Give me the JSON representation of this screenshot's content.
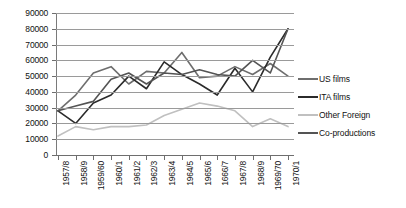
{
  "chart_data": {
    "type": "line",
    "title": "",
    "xlabel": "",
    "ylabel": "",
    "ylim": [
      0,
      90000
    ],
    "ytick_step": 10000,
    "grid": true,
    "legend_position": "right",
    "categories": [
      "1957/8",
      "1958/9",
      "1959/60",
      "1960/1",
      "1961/2",
      "1962/3",
      "1963/4",
      "1964/5",
      "1965/6",
      "1666/7",
      "1967/8",
      "1968/9",
      "1969/70",
      "1970/1"
    ],
    "ytick_labels": [
      "90000",
      "80000",
      "70000",
      "60000",
      "50000",
      "40000",
      "30000",
      "20000",
      "10000",
      "0"
    ],
    "series": [
      {
        "name": "US films",
        "color": "#6e6e6e",
        "values": [
          28000,
          38000,
          52000,
          56000,
          45000,
          53000,
          52000,
          65000,
          49000,
          50000,
          56000,
          51000,
          58000,
          50000
        ]
      },
      {
        "name": "ITA films",
        "color": "#2b2b2b",
        "values": [
          28000,
          20000,
          33000,
          38000,
          50000,
          42000,
          59000,
          51000,
          45000,
          38000,
          55000,
          40000,
          62000,
          80000
        ]
      },
      {
        "name": "Other Foreign",
        "color": "#c0c0c0",
        "values": [
          12000,
          18000,
          16000,
          18000,
          18000,
          19000,
          25000,
          29000,
          33000,
          31000,
          28000,
          18000,
          23000,
          18000
        ]
      },
      {
        "name": "Co-productions",
        "color": "#545454",
        "values": [
          28000,
          31000,
          34000,
          48000,
          52000,
          45000,
          52000,
          51000,
          54000,
          51000,
          50000,
          60000,
          52000,
          80000
        ]
      }
    ]
  },
  "legend": {
    "items": [
      {
        "label": "US films"
      },
      {
        "label": "ITA films"
      },
      {
        "label": "Other Foreign"
      },
      {
        "label": "Co-productions"
      }
    ]
  }
}
